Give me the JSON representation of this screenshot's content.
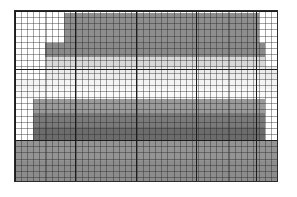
{
  "figure": {
    "title": "",
    "background_color": "#ffffff",
    "frame_color": "#2b2b2b"
  },
  "plot_area": {
    "left": 14,
    "top": 10,
    "width": 264,
    "height": 172,
    "minor_grid": true,
    "minor_cell_width": 6.1,
    "minor_cell_height": 6.15,
    "major_grid": true,
    "major_grid_color": "#1c1c1c"
  },
  "chart_data": {
    "type": "heatmap",
    "title": "",
    "subtitle": "",
    "xlabel": "",
    "ylabel": "",
    "xlim": [
      0,
      43
    ],
    "ylim": [
      0,
      28
    ],
    "grid": true,
    "legend": "none",
    "colormap": "grayscale",
    "categories": [
      "band-1",
      "band-2",
      "band-3",
      "band-4",
      "band-5",
      "band-6",
      "band-7",
      "band-8",
      "band-9",
      "band-10",
      "band-11",
      "band-12"
    ],
    "bands": [
      {
        "name": "band-1",
        "x_start": 0,
        "x_end": 43,
        "y_top": 0,
        "y_bottom": 1,
        "gray": "#ffffff",
        "value": 100
      },
      {
        "name": "band-2",
        "x_start": 8,
        "x_end": 40,
        "y_top": 1,
        "y_bottom": 19,
        "gray": "#8e8e8e",
        "value": 56
      },
      {
        "name": "band-3",
        "x_start": 5,
        "x_end": 41,
        "y_top": 19,
        "y_bottom": 27,
        "gray": "#8a8a8a",
        "value": 54
      },
      {
        "name": "band-4",
        "x_start": 5,
        "x_end": 41,
        "y_top": 27,
        "y_bottom": 33,
        "gray": "#d8d8d8",
        "value": 85
      },
      {
        "name": "band-5",
        "x_start": 5,
        "x_end": 43,
        "y_top": 33,
        "y_bottom": 40,
        "gray": "#ececec",
        "value": 93
      },
      {
        "name": "band-6",
        "x_start": 0,
        "x_end": 43,
        "y_top": 40,
        "y_bottom": 46,
        "gray": "#f4f4f4",
        "value": 96
      },
      {
        "name": "band-7",
        "x_start": 0,
        "x_end": 43,
        "y_top": 46,
        "y_bottom": 52,
        "gray": "#fafafa",
        "value": 98
      },
      {
        "name": "band-8",
        "x_start": 3,
        "x_end": 41,
        "y_top": 52,
        "y_bottom": 60,
        "gray": "#9a9a9a",
        "value": 60
      },
      {
        "name": "band-9",
        "x_start": 3,
        "x_end": 41,
        "y_top": 60,
        "y_bottom": 68,
        "gray": "#7a7a7a",
        "value": 48
      },
      {
        "name": "band-10",
        "x_start": 3,
        "x_end": 41,
        "y_top": 68,
        "y_bottom": 76,
        "gray": "#6c6c6c",
        "value": 42
      },
      {
        "name": "band-11",
        "x_start": 0,
        "x_end": 43,
        "y_top": 76,
        "y_bottom": 88,
        "gray": "#949494",
        "value": 58
      },
      {
        "name": "band-12",
        "x_start": 0,
        "x_end": 43,
        "y_top": 88,
        "y_bottom": 100,
        "gray": "#8c8c8c",
        "value": 55
      }
    ],
    "major_gridlines_x": [
      0,
      23,
      46,
      69,
      92,
      100
    ],
    "major_gridlines_y": [
      0,
      34,
      76,
      100
    ],
    "tick_labels_x": [],
    "tick_labels_y": []
  }
}
